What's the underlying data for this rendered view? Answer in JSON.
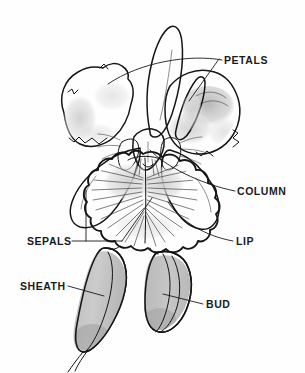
{
  "diagram": {
    "background_color": "#fefefe",
    "line_color": "#151515",
    "label_color": "#1a1a1a",
    "shade_light": "#d9d9d9",
    "shade_medium": "#bdbdbd",
    "shade_dark": "#a9a9a9"
  },
  "labels": [
    {
      "id": "petals",
      "text": "PETALS",
      "x": 224,
      "y": 64,
      "anchor": "start"
    },
    {
      "id": "column",
      "text": "COLUMN",
      "x": 237,
      "y": 195,
      "anchor": "start"
    },
    {
      "id": "sepals",
      "text": "SEPALS",
      "x": 27,
      "y": 245,
      "anchor": "start"
    },
    {
      "id": "lip",
      "text": "LIP",
      "x": 236,
      "y": 245,
      "anchor": "start"
    },
    {
      "id": "sheath",
      "text": "SHEATH",
      "x": 20,
      "y": 290,
      "anchor": "start"
    },
    {
      "id": "bud",
      "text": "BUD",
      "x": 206,
      "y": 308,
      "anchor": "start"
    }
  ],
  "parts": [
    {
      "id": "dorsal-sepal",
      "name": "Dorsal sepal"
    },
    {
      "id": "left-petal",
      "name": "Left petal"
    },
    {
      "id": "right-petal",
      "name": "Right petal"
    },
    {
      "id": "left-lateral-sepal",
      "name": "Left lateral sepal"
    },
    {
      "id": "right-lateral-sepal",
      "name": "Right lateral sepal"
    },
    {
      "id": "column",
      "name": "Column"
    },
    {
      "id": "lip",
      "name": "Lip (labellum)"
    },
    {
      "id": "sheath",
      "name": "Sheath"
    },
    {
      "id": "bud",
      "name": "Bud"
    }
  ]
}
